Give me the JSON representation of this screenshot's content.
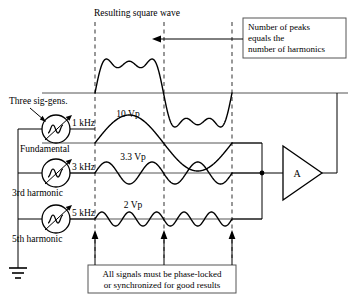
{
  "figure": {
    "title_top": "Resulting square wave",
    "callout_top": {
      "line1": "Number of peaks",
      "line2": "equals the",
      "line3": "number of harmonics"
    },
    "callout_bottom": {
      "line1": "All signals must be phase-locked",
      "line2": "or synchronized for good results"
    },
    "sig_gens_label": "Three sig-gens.",
    "amplifier_label": "A",
    "ground": "ground-symbol"
  },
  "generators": [
    {
      "freq": "1 kHz",
      "name": "Fundamental",
      "amplitude": "10 Vp"
    },
    {
      "freq": "3 kHz",
      "name": "3rd harmonic",
      "amplitude": "3.3 Vp"
    },
    {
      "freq": "5 kHz",
      "name": "5th harmonic",
      "amplitude": "2 Vp"
    }
  ],
  "chart_data": {
    "type": "line",
    "title": "Resulting square wave",
    "xlabel": "",
    "ylabel": "",
    "grid": false,
    "legend": "none",
    "annotations": [
      "Number of peaks equals the number of harmonics",
      "All signals must be phase-locked or synchronized for good results"
    ],
    "x_marker_cycles": [
      0,
      0.5,
      1.0
    ],
    "series": [
      {
        "name": "Resulting square wave",
        "harmonics": [
          1,
          3,
          5
        ],
        "amplitudes_vp": [
          10,
          3.3,
          2
        ],
        "peaks_per_half_cycle": 3,
        "cycles_shown": 1,
        "amplitude_px": 34
      },
      {
        "name": "Fundamental",
        "frequency_khz": 1,
        "amplitude_vp": 10,
        "cycles_shown": 1,
        "amplitude_px": 28
      },
      {
        "name": "3rd harmonic",
        "frequency_khz": 3,
        "amplitude_vp": 3.3,
        "cycles_shown": 3,
        "amplitude_px": 11
      },
      {
        "name": "5th harmonic",
        "frequency_khz": 5,
        "amplitude_vp": 2,
        "cycles_shown": 5,
        "amplitude_px": 7
      }
    ]
  }
}
